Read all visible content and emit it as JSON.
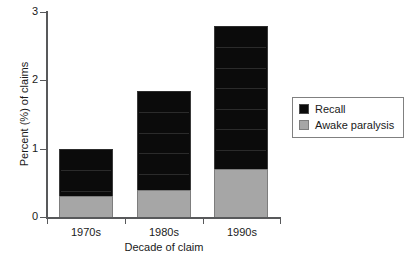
{
  "chart_data": {
    "type": "bar",
    "stacked": true,
    "title": "",
    "xlabel": "Decade of claim",
    "ylabel": "Percent (%) of claims",
    "categories": [
      "1970s",
      "1980s",
      "1990s"
    ],
    "series": [
      {
        "name": "Recall",
        "color": "#0b0b0b",
        "values": [
          0.7,
          1.45,
          2.1
        ]
      },
      {
        "name": "Awake paralysis",
        "color": "#a6a6a6",
        "values": [
          0.3,
          0.4,
          0.7
        ]
      }
    ],
    "stack_totals": [
      1.0,
      1.85,
      2.8
    ],
    "ylim": [
      0,
      3
    ],
    "yticks": [
      "0",
      "1",
      "2",
      "3"
    ],
    "ytick_values": [
      0,
      1,
      2,
      3
    ],
    "grid": false,
    "legend_position": "right"
  },
  "axes": {
    "y_title": "Percent (%) of claims",
    "x_title": "Decade of claim",
    "y_tick_labels": [
      "3",
      "2",
      "1",
      "0"
    ],
    "x_tick_labels": [
      "1970s",
      "1980s",
      "1990s"
    ]
  },
  "legend": {
    "items": [
      {
        "label": "Recall",
        "swatch": "black-swatch-icon"
      },
      {
        "label": "Awake paralysis",
        "swatch": "gray-swatch-icon"
      }
    ]
  }
}
